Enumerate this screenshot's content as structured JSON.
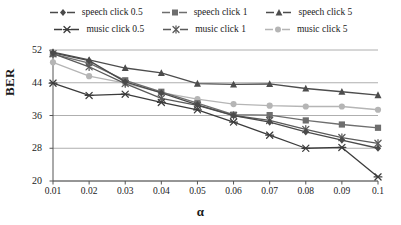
{
  "chart_data": {
    "type": "line",
    "title": "",
    "xlabel": "α",
    "ylabel": "BER",
    "x": [
      0.01,
      0.02,
      0.03,
      0.04,
      0.05,
      0.06,
      0.07,
      0.08,
      0.09,
      0.1
    ],
    "xticklabels": [
      "0.01",
      "0.02",
      "0.03",
      "0.04",
      "0.05",
      "0.06",
      "0.07",
      "0.08",
      "0.09",
      "0.1"
    ],
    "yticks": [
      20,
      28,
      36,
      44,
      52
    ],
    "yticklabels": [
      "20",
      "28",
      "36",
      "44",
      "52"
    ],
    "ylim": [
      20,
      52
    ],
    "xlim": [
      0.01,
      0.1
    ],
    "grid": "horizontal",
    "legend_position": "top",
    "series": [
      {
        "name": "speech click 0.5",
        "marker": "diamond",
        "color": "#4a4a4a",
        "values": [
          51.3,
          49.4,
          44.2,
          41.5,
          38.6,
          36.0,
          34.4,
          32.0,
          30.0,
          28.0
        ]
      },
      {
        "name": "speech click 1",
        "marker": "square",
        "color": "#6e6e6e",
        "values": [
          51.0,
          48.8,
          44.6,
          41.8,
          39.0,
          36.2,
          36.1,
          34.8,
          33.8,
          33.0
        ]
      },
      {
        "name": "speech click 5",
        "marker": "triangle",
        "color": "#4d4d4d",
        "values": [
          51.5,
          49.6,
          47.6,
          46.4,
          43.8,
          43.6,
          43.7,
          42.6,
          41.8,
          41.0
        ]
      },
      {
        "name": "music click 0.5",
        "marker": "x-bar",
        "color": "#3c3c3c",
        "values": [
          43.9,
          40.9,
          41.2,
          39.2,
          37.4,
          34.4,
          31.2,
          28.0,
          28.2,
          21.0
        ]
      },
      {
        "name": "music click 1",
        "marker": "asterisk",
        "color": "#5a5a5a",
        "values": [
          51.1,
          47.9,
          43.8,
          40.2,
          38.5,
          36.0,
          34.8,
          32.6,
          30.6,
          29.2
        ]
      },
      {
        "name": "music click 5",
        "marker": "circle",
        "color": "#b5b5b5",
        "values": [
          49.0,
          45.6,
          43.9,
          41.6,
          40.0,
          38.8,
          38.4,
          38.2,
          38.2,
          37.4
        ]
      }
    ]
  },
  "legend": {
    "rows": [
      [
        {
          "label": "speech click 0.5"
        },
        {
          "label": "speech click 1"
        },
        {
          "label": "speech click 5"
        }
      ],
      [
        {
          "label": "music click 0.5"
        },
        {
          "label": "music click 1"
        },
        {
          "label": "music click 5"
        }
      ]
    ]
  }
}
